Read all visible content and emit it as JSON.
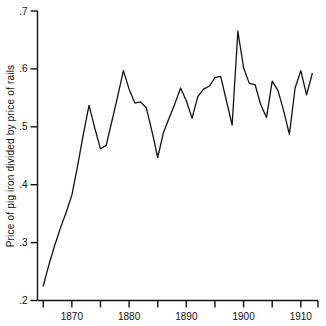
{
  "chart_data": {
    "type": "line",
    "title": "",
    "xlabel": "",
    "ylabel": "Price of pig iron divided by price of rails",
    "xlim": [
      1864,
      1913
    ],
    "ylim": [
      0.2,
      0.7
    ],
    "grid": false,
    "legend": "none",
    "x_major_ticks": [
      1870,
      1880,
      1890,
      1900,
      1910
    ],
    "x_major_tick_labels": [
      "1870",
      "1880",
      "1890",
      "1900",
      "1910"
    ],
    "x_minor_ticks": [
      1865,
      1875,
      1885,
      1895,
      1905,
      1913
    ],
    "y_ticks": [
      0.2,
      0.3,
      0.4,
      0.5,
      0.6,
      0.7
    ],
    "y_tick_labels": [
      ".2",
      ".3",
      ".4",
      ".5",
      ".6",
      ".7"
    ],
    "series": [
      {
        "name": "Price of pig iron divided by price of rails",
        "color": "#111111",
        "x": [
          1865,
          1866,
          1867,
          1868,
          1869,
          1870,
          1871,
          1872,
          1873,
          1874,
          1875,
          1876,
          1877,
          1878,
          1879,
          1880,
          1881,
          1882,
          1883,
          1884,
          1885,
          1886,
          1887,
          1888,
          1889,
          1890,
          1891,
          1892,
          1893,
          1894,
          1895,
          1896,
          1897,
          1898,
          1899,
          1900,
          1901,
          1902,
          1903,
          1904,
          1905,
          1906,
          1907,
          1908,
          1909,
          1910,
          1911,
          1912
        ],
        "y": [
          0.225,
          0.262,
          0.295,
          0.325,
          0.352,
          0.382,
          0.432,
          0.487,
          0.537,
          0.498,
          0.462,
          0.468,
          0.51,
          0.552,
          0.597,
          0.565,
          0.541,
          0.543,
          0.533,
          0.492,
          0.447,
          0.49,
          0.515,
          0.54,
          0.567,
          0.545,
          0.515,
          0.552,
          0.565,
          0.57,
          0.585,
          0.587,
          0.545,
          0.503,
          0.665,
          0.602,
          0.575,
          0.573,
          0.538,
          0.516,
          0.579,
          0.563,
          0.528,
          0.487,
          0.567,
          0.597,
          0.555,
          0.592
        ]
      }
    ]
  },
  "axis": {
    "y_title": "Price of pig iron divided by price of rails"
  }
}
